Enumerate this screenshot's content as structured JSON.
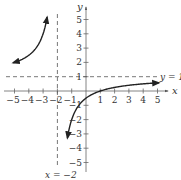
{
  "chart_data": {
    "type": "line",
    "title": "",
    "function": "f(x) = (x - 1)/(x + 2)",
    "xlabel": "x",
    "ylabel": "y",
    "xlim": [
      -5.8,
      6
    ],
    "ylim": [
      -6,
      6
    ],
    "grid": false,
    "x_ticks": [
      -5,
      -4,
      -3,
      -2,
      -1,
      1,
      2,
      3,
      4,
      5
    ],
    "y_ticks": [
      -5,
      -4,
      -3,
      -2,
      -1,
      1,
      2,
      3,
      4,
      5
    ],
    "asymptotes": [
      {
        "type": "vertical",
        "value": -2,
        "label": "x = −2"
      },
      {
        "type": "horizontal",
        "value": 1,
        "label": "y = 1"
      }
    ],
    "series": [
      {
        "name": "left-branch",
        "x": [
          -5,
          -4.5,
          -4,
          -3.5,
          -3,
          -2.75
        ],
        "y": [
          2,
          2.2,
          2.5,
          3,
          4,
          5
        ]
      },
      {
        "name": "right-branch",
        "x": [
          -1.25,
          -1,
          -0.5,
          0,
          1,
          2,
          3,
          4,
          5
        ],
        "y": [
          -3,
          -2,
          -1,
          -0.5,
          0,
          0.25,
          0.4,
          0.5,
          0.571
        ]
      }
    ]
  },
  "labels": {
    "x_axis": "x",
    "y_axis": "y",
    "vertical_asymptote": "x = −2",
    "horizontal_asymptote": "y = 1",
    "x_ticks": [
      "−5",
      "−4",
      "−3",
      "−2",
      "−1",
      "1",
      "2",
      "3",
      "4",
      "5"
    ],
    "y_ticks": [
      "5",
      "4",
      "3",
      "2",
      "1",
      "−1",
      "−2",
      "−3",
      "−4",
      "−5"
    ]
  }
}
